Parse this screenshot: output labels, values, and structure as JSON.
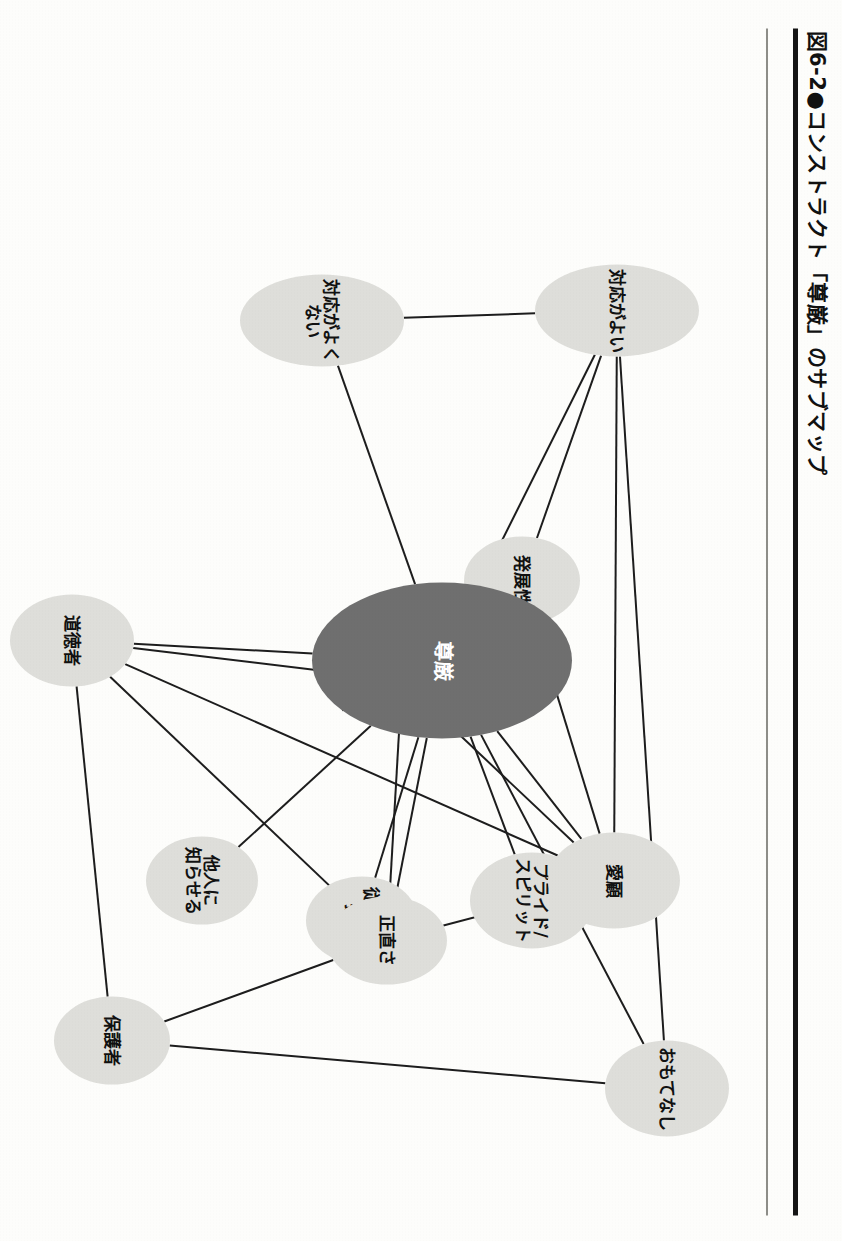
{
  "figure": {
    "caption": "図6-2●コンストラクト「尊厳」のサブマップ",
    "caption_number": "図6-2",
    "caption_bullet": "●",
    "caption_title": "コンストラクト「尊厳」のサブマップ",
    "page_rotation_deg": 90
  },
  "colors": {
    "page_background": "#fdfdfb",
    "rule_thick": "#151515",
    "rule_thin": "#8d8d88",
    "node_fill": "#dededa",
    "node_text": "#111111",
    "central_node_fill": "#6f6f6f",
    "central_node_text": "#ffffff",
    "edge_stroke": "#1d1d1d"
  },
  "chart_data": {
    "type": "diagram",
    "subtype": "network-graph",
    "title": "図6-2●コンストラクト「尊厳」のサブマップ",
    "legend": [],
    "grid": false,
    "nodes": [
      {
        "id": "songen",
        "label": "尊厳",
        "role": "central",
        "x": 660,
        "y": 320,
        "rx": 78,
        "ry": 130
      },
      {
        "id": "omotenashi",
        "label": "おもてなし",
        "role": "peripheral",
        "x": 1088,
        "y": 95,
        "rx": 48,
        "ry": 62
      },
      {
        "id": "pride",
        "label": "プライド/\nスピリット",
        "role": "peripheral",
        "x": 900,
        "y": 230,
        "rx": 48,
        "ry": 62
      },
      {
        "id": "jugyoin",
        "label": "従業員の\n扱い",
        "role": "peripheral",
        "x": 920,
        "y": 400,
        "rx": 44,
        "ry": 56
      },
      {
        "id": "taninni",
        "label": "他人に\n知らせる",
        "role": "peripheral",
        "x": 880,
        "y": 560,
        "rx": 44,
        "ry": 56
      },
      {
        "id": "taiouyoi",
        "label": "対応がよい",
        "role": "peripheral",
        "x": 310,
        "y": 145,
        "rx": 46,
        "ry": 82
      },
      {
        "id": "taiouyokunai",
        "label": "対応がよくない",
        "role": "peripheral",
        "x": 320,
        "y": 440,
        "rx": 46,
        "ry": 82
      },
      {
        "id": "hattensei",
        "label": "発展性",
        "role": "peripheral",
        "x": 580,
        "y": 240,
        "rx": 44,
        "ry": 58
      },
      {
        "id": "aiko",
        "label": "愛顧",
        "role": "peripheral",
        "x": 880,
        "y": 148,
        "rx": 48,
        "ry": 66
      },
      {
        "id": "rikoteki",
        "label": "利己的",
        "role": "peripheral",
        "x": 680,
        "y": 360,
        "rx": 44,
        "ry": 58
      },
      {
        "id": "dotokusha",
        "label": "道徳者",
        "role": "peripheral",
        "x": 640,
        "y": 690,
        "rx": 46,
        "ry": 62
      },
      {
        "id": "shojikisa",
        "label": "正直さ",
        "role": "peripheral",
        "x": 940,
        "y": 375,
        "rx": 44,
        "ry": 60
      },
      {
        "id": "hogosha",
        "label": "保護者",
        "role": "peripheral",
        "x": 1040,
        "y": 650,
        "rx": 44,
        "ry": 58
      }
    ],
    "edges": [
      {
        "from": "songen",
        "to": "omotenashi"
      },
      {
        "from": "songen",
        "to": "pride"
      },
      {
        "from": "songen",
        "to": "jugyoin"
      },
      {
        "from": "songen",
        "to": "taninni"
      },
      {
        "from": "songen",
        "to": "taiouyokunai"
      },
      {
        "from": "songen",
        "to": "taiouyoi"
      },
      {
        "from": "songen",
        "to": "hattensei"
      },
      {
        "from": "songen",
        "to": "aiko"
      },
      {
        "from": "songen",
        "to": "rikoteki"
      },
      {
        "from": "songen",
        "to": "dotokusha"
      },
      {
        "from": "songen",
        "to": "shojikisa"
      },
      {
        "from": "taiouyoi",
        "to": "omotenashi"
      },
      {
        "from": "taiouyoi",
        "to": "taiouyokunai"
      },
      {
        "from": "taiouyoi",
        "to": "hattensei"
      },
      {
        "from": "taiouyoi",
        "to": "aiko"
      },
      {
        "from": "omotenashi",
        "to": "hogosha"
      },
      {
        "from": "aiko",
        "to": "rikoteki"
      },
      {
        "from": "aiko",
        "to": "dotokusha"
      },
      {
        "from": "aiko",
        "to": "shojikisa"
      },
      {
        "from": "aiko",
        "to": "hattensei"
      },
      {
        "from": "rikoteki",
        "to": "dotokusha"
      },
      {
        "from": "rikoteki",
        "to": "shojikisa"
      },
      {
        "from": "dotokusha",
        "to": "shojikisa"
      },
      {
        "from": "dotokusha",
        "to": "hogosha"
      },
      {
        "from": "shojikisa",
        "to": "hogosha"
      }
    ]
  }
}
